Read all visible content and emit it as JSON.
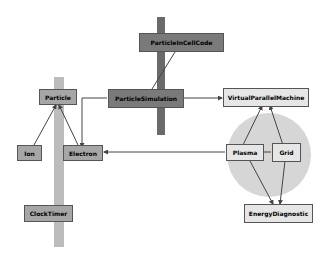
{
  "colors": {
    "dark_bar": "#6a6a6a",
    "light_bar": "#bcbcbc",
    "dark_node": "#7a7a7a",
    "mid_node": "#a6a6a6",
    "light_node": "#e6e6e6",
    "region": "#d6d6d6",
    "edge": "#444444"
  },
  "nodes": [
    {
      "id": "top",
      "label": "ParticleInCellCode"
    },
    {
      "id": "center",
      "label": "ParticleSimulation"
    },
    {
      "id": "vpm",
      "label": "VirtualParallelMachine"
    },
    {
      "id": "particle",
      "label": "Particle"
    },
    {
      "id": "ion",
      "label": "Ion"
    },
    {
      "id": "electron",
      "label": "Electron"
    },
    {
      "id": "plasma",
      "label": "Plasma"
    },
    {
      "id": "grid",
      "label": "Grid"
    },
    {
      "id": "energy",
      "label": "EnergyDiagnostic"
    },
    {
      "id": "clock",
      "label": "ClockTimer"
    }
  ]
}
